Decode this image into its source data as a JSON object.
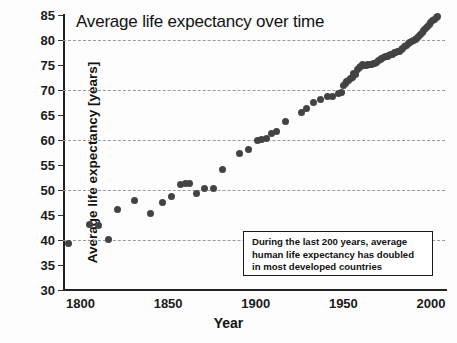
{
  "chart_data": {
    "type": "scatter",
    "title": "Average life expectancy over time",
    "xlabel": "Year",
    "ylabel": "Average life expectancy [years]",
    "xlim": [
      1790,
      2008
    ],
    "ylim": [
      30,
      85
    ],
    "xticks": [
      1800,
      1850,
      1900,
      1950,
      2000
    ],
    "yticks": [
      30,
      35,
      40,
      45,
      50,
      55,
      60,
      65,
      70,
      75,
      80,
      85
    ],
    "grid": "horizontal-dashed-at-40-50-60-70-80",
    "gridlines": [
      40,
      50,
      60,
      70,
      80
    ],
    "legend": "none",
    "marker_color": "#434343",
    "annotations": [
      {
        "text": "During the last 200 years, average human life expectancy has doubled in most developed countries",
        "lines": [
          "During the last 200 years, average",
          "human life expectancy has doubled",
          "in most developed countries"
        ],
        "box": true
      }
    ],
    "x": [
      1793,
      1805,
      1810,
      1816,
      1821,
      1831,
      1840,
      1847,
      1852,
      1857,
      1860,
      1862,
      1866,
      1871,
      1876,
      1881,
      1891,
      1896,
      1901,
      1903,
      1906,
      1909,
      1912,
      1917,
      1926,
      1929,
      1933,
      1937,
      1941,
      1944,
      1947,
      1949,
      1950,
      1951,
      1952,
      1953,
      1954,
      1955,
      1956,
      1957,
      1958,
      1959,
      1960,
      1961,
      1962,
      1963,
      1964,
      1965,
      1966,
      1967,
      1968,
      1969,
      1970,
      1971,
      1972,
      1973,
      1974,
      1975,
      1976,
      1977,
      1978,
      1979,
      1980,
      1981,
      1982,
      1983,
      1984,
      1985,
      1986,
      1987,
      1988,
      1989,
      1990,
      1991,
      1992,
      1993,
      1994,
      1995,
      1996,
      1997,
      1998,
      1999,
      2000,
      2001,
      2002,
      2003,
      2004
    ],
    "y": [
      39.4,
      43.1,
      43.0,
      40.2,
      46.2,
      48.0,
      45.3,
      47.6,
      48.7,
      51.1,
      51.4,
      51.3,
      49.4,
      50.4,
      50.4,
      54.2,
      57.3,
      58.2,
      59.9,
      60.2,
      60.4,
      61.4,
      61.8,
      63.7,
      65.6,
      66.4,
      67.6,
      68.2,
      68.7,
      68.8,
      69.4,
      69.5,
      70.9,
      71.3,
      71.8,
      72.0,
      72.3,
      72.6,
      73.4,
      73.2,
      74.2,
      74.5,
      74.8,
      75.1,
      74.9,
      75.0,
      75.1,
      75.1,
      75.2,
      75.3,
      75.4,
      75.6,
      75.9,
      76.2,
      76.4,
      76.5,
      76.7,
      76.8,
      76.9,
      77.1,
      77.2,
      77.5,
      77.6,
      77.7,
      77.8,
      78.1,
      78.3,
      78.8,
      79.0,
      79.4,
      79.6,
      79.8,
      79.9,
      80.1,
      80.4,
      80.7,
      81.1,
      81.5,
      81.9,
      82.3,
      82.7,
      83.1,
      83.5,
      83.9,
      84.2,
      84.5,
      84.7
    ]
  },
  "figure": {
    "background_color": "#fdfdfd",
    "axis_color": "#222222",
    "grid_color": "#9a9a9a",
    "text_color": "#1a1a1a"
  }
}
